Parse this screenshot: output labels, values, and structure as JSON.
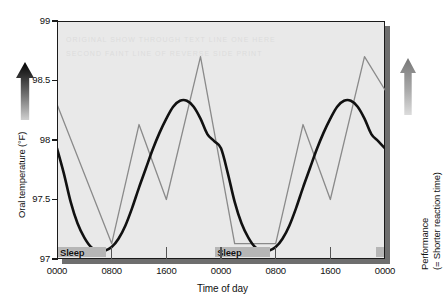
{
  "figure": {
    "x_title": "Time of day",
    "y_title_left": "Oral temperature (°F)",
    "y_title_right_line1": "Performance",
    "y_title_right_line2": "(= Shorter reaction time)",
    "sleep_label": "Sleep",
    "arrow_left_name": "up-arrow-icon",
    "arrow_right_name": "up-arrow-icon",
    "colors": {
      "plot_background": "#e9e9e9",
      "plot_shadow": "#6e6e6e",
      "temperature_line": "#111111",
      "performance_line": "#8a8a8a",
      "sleep_bar": "#b6b6b6",
      "axis": "#1a1a1a"
    }
  },
  "chart_data": {
    "type": "line",
    "title": "",
    "xlabel": "Time of day",
    "ylabel": "Oral temperature (°F)",
    "ylabel_right": "Performance (= Shorter reaction time)",
    "grid": false,
    "legend_position": "none",
    "xlim": [
      0,
      48
    ],
    "ylim": [
      97,
      99
    ],
    "yticks": [
      97,
      97.5,
      98,
      98.5,
      99
    ],
    "ytick_labels": [
      "97",
      "97.5",
      "98",
      "98.5",
      "99"
    ],
    "xticks": [
      0,
      8,
      16,
      24,
      32,
      40,
      48
    ],
    "xtick_labels": [
      "0000",
      "0800",
      "1600",
      "0000",
      "0800",
      "1600",
      "0000"
    ],
    "series": [
      {
        "name": "Oral temperature",
        "color": "#111111",
        "width": 2.6,
        "smooth": true,
        "axis": "left",
        "x": [
          0,
          1,
          2,
          3,
          4,
          5,
          6,
          7,
          8,
          9,
          10,
          11,
          12,
          13,
          14,
          15,
          16,
          17,
          18,
          19,
          20,
          21,
          22,
          23,
          24,
          25,
          26,
          27,
          28,
          29,
          30,
          31,
          32,
          33,
          34,
          35,
          36,
          37,
          38,
          39,
          40,
          41,
          42,
          43,
          44,
          45,
          46,
          47,
          48
        ],
        "values": [
          97.93,
          97.72,
          97.48,
          97.3,
          97.18,
          97.1,
          97.07,
          97.07,
          97.1,
          97.17,
          97.28,
          97.43,
          97.6,
          97.76,
          97.92,
          98.06,
          98.18,
          98.28,
          98.33,
          98.33,
          98.28,
          98.18,
          98.05,
          97.99,
          97.93,
          97.72,
          97.48,
          97.3,
          97.18,
          97.1,
          97.07,
          97.07,
          97.1,
          97.17,
          97.28,
          97.43,
          97.6,
          97.76,
          97.92,
          98.06,
          98.18,
          98.28,
          98.33,
          98.33,
          98.28,
          98.18,
          98.05,
          97.99,
          97.93
        ]
      },
      {
        "name": "Performance",
        "color": "#8a8a8a",
        "width": 1.3,
        "smooth": false,
        "axis": "right",
        "x": [
          0,
          8,
          12,
          16,
          21,
          26,
          32,
          36,
          40,
          45,
          48
        ],
        "values": [
          98.3,
          97.13,
          98.13,
          97.5,
          98.7,
          97.13,
          97.13,
          98.13,
          97.5,
          98.7,
          98.42
        ]
      }
    ],
    "annotations": [
      {
        "label": "Sleep",
        "x_start": 0,
        "x_end": 7.2,
        "kind": "sleep-band"
      },
      {
        "label": "Sleep",
        "x_start": 23.0,
        "x_end": 31.2,
        "kind": "sleep-band"
      },
      {
        "label": "",
        "x_start": 46.5,
        "x_end": 48.0,
        "kind": "sleep-band"
      }
    ]
  }
}
